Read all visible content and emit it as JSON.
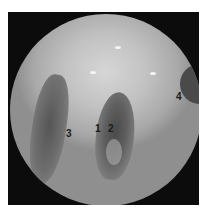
{
  "image": {
    "description": "Grayscale circular endoscopic view of the larynx with numbered anatomical labels",
    "frame_color": "#0c0c0c",
    "background": "#ffffff"
  },
  "labels": [
    {
      "text": "1",
      "x": 95,
      "y": 124
    },
    {
      "text": "2",
      "x": 108,
      "y": 124
    },
    {
      "text": "3",
      "x": 66,
      "y": 129
    },
    {
      "text": "4",
      "x": 176,
      "y": 92
    }
  ]
}
